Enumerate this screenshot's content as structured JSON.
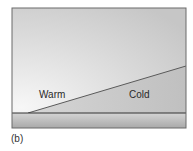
{
  "diagram": {
    "type": "weather-front-cross-section",
    "labels": {
      "warm": "Warm",
      "cold": "Cold"
    },
    "caption": "(b)",
    "colors": {
      "sky_light": "#f2f2f2",
      "sky_dark": "#c8c8c8",
      "cold_air": "#c4c4c4",
      "ground_top": "#d6d6d6",
      "ground_bottom": "#a8a8a8",
      "line": "#555555",
      "frame": "#6a6a6a"
    }
  }
}
